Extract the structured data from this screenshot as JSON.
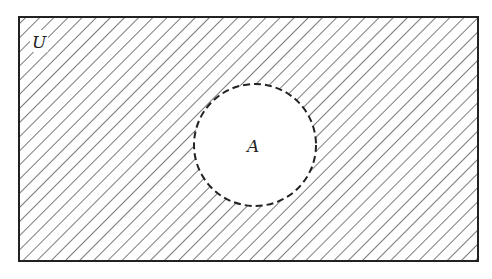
{
  "diagram": {
    "type": "venn",
    "universe": {
      "label": "U",
      "x": 19,
      "y": 17,
      "width": 459,
      "height": 244
    },
    "set": {
      "label": "A",
      "cx": 255,
      "cy": 145,
      "r": 61,
      "border": "dashed"
    },
    "shaded_region": "complement of A (U minus A)",
    "hatch": {
      "direction": "diagonal top-left to bottom-right",
      "spacing": 10,
      "color": "#333333"
    },
    "colors": {
      "line": "#222222",
      "background": "#ffffff"
    }
  }
}
